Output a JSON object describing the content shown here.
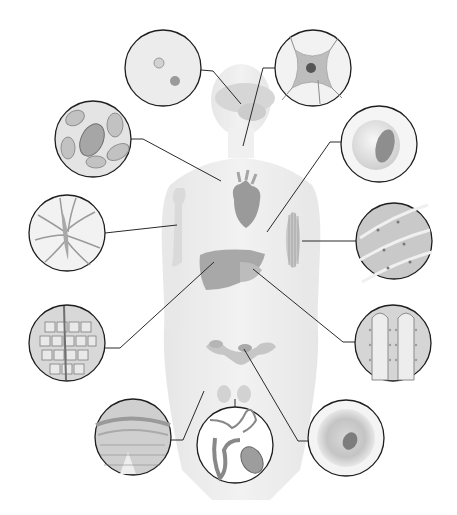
{
  "diagram": {
    "colors": {
      "background": "#ffffff",
      "body_silhouette": "#ececec",
      "body_shadow": "#e2e2e2",
      "organ": "#bdbdbd",
      "organ_dark": "#8f8f8f",
      "circle_stroke": "#1e1e1e",
      "circle_fill": "#e6e6e6",
      "leader_line": "#2a2a2a"
    },
    "insets": [
      {
        "id": "bone-cells",
        "cx": 163,
        "cy": 68,
        "r": 38,
        "target": [
          241,
          104
        ],
        "elbow": [
          204,
          71
        ]
      },
      {
        "id": "nerve-cell",
        "cx": 313,
        "cy": 68,
        "r": 38,
        "target": [
          243,
          146
        ],
        "elbow": [
          274,
          68
        ]
      },
      {
        "id": "blood-cells",
        "cx": 93,
        "cy": 139,
        "r": 38,
        "target": [
          221,
          181
        ],
        "elbow": [
          131,
          139
        ]
      },
      {
        "id": "fat-cell",
        "cx": 379,
        "cy": 144,
        "r": 38,
        "target": [
          267,
          232
        ],
        "elbow": [
          341,
          142
        ]
      },
      {
        "id": "connective-cartilage-cells",
        "cx": 67,
        "cy": 233,
        "r": 38,
        "target": [
          177,
          225
        ],
        "elbow": [
          105,
          233
        ]
      },
      {
        "id": "skeletal-muscle-cells",
        "cx": 394,
        "cy": 241,
        "r": 38,
        "target": [
          302,
          241
        ],
        "elbow": [
          356,
          241
        ]
      },
      {
        "id": "liver-epithelial-cells",
        "cx": 67,
        "cy": 343,
        "r": 38,
        "target": [
          214,
          262
        ],
        "elbow": [
          120,
          348
        ]
      },
      {
        "id": "intestinal-lining-cells",
        "cx": 393,
        "cy": 343,
        "r": 38,
        "target": [
          253,
          269
        ],
        "elbow": [
          355,
          342
        ]
      },
      {
        "id": "skin-epithelial-cells",
        "cx": 133,
        "cy": 437,
        "r": 38,
        "target": [
          204,
          391
        ],
        "elbow": [
          183,
          440
        ]
      },
      {
        "id": "sperm-cell",
        "cx": 235,
        "cy": 445,
        "r": 38,
        "target": [
          235,
          399
        ],
        "elbow": [
          235,
          407
        ]
      },
      {
        "id": "egg-cell",
        "cx": 346,
        "cy": 438,
        "r": 38,
        "target": [
          244,
          349
        ],
        "elbow": [
          308,
          441
        ]
      }
    ]
  }
}
